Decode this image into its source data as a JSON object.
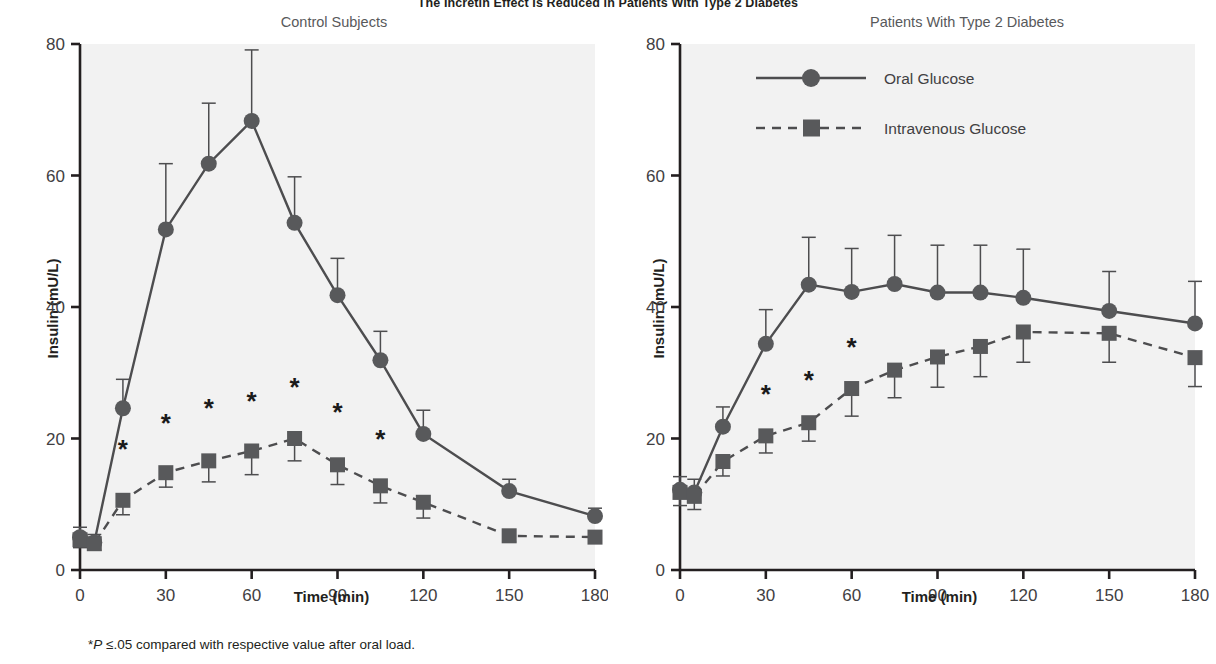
{
  "figure": {
    "title": "The Incretin Effect Is Reduced in Patients With Type 2 Diabetes",
    "footnote_prefix": "*",
    "footnote_italic": "P",
    "footnote_rest": " ≤.05 compared with respective value after oral load.",
    "footnote_full": "*P ≤.05 compared with respective value after oral load.",
    "colors": {
      "line": "#4d4d4f",
      "marker": "#58595b",
      "axis": "#231f20",
      "plot_bg": "#f2f2f2",
      "tick_label": "#414042",
      "panel_title": "#58595b"
    }
  },
  "legend": {
    "position": "top-right-of-right-panel",
    "items": [
      {
        "label": "Oral Glucose",
        "marker": "circle",
        "line_style": "solid"
      },
      {
        "label": "Intravenous Glucose",
        "marker": "square",
        "line_style": "dashed"
      }
    ]
  },
  "chart_data": [
    {
      "type": "line",
      "panel": "left",
      "title": "Control Subjects",
      "xlabel": "Time (min)",
      "ylabel": "Insulin (mU/L)",
      "xlim": [
        0,
        180
      ],
      "ylim": [
        0,
        80
      ],
      "xticks": [
        0,
        30,
        60,
        90,
        120,
        150,
        180
      ],
      "yticks": [
        0,
        20,
        40,
        60,
        80
      ],
      "grid": false,
      "x": [
        0,
        5,
        15,
        30,
        45,
        60,
        75,
        90,
        105,
        120,
        150,
        180
      ],
      "series": [
        {
          "name": "Oral Glucose",
          "marker": "circle",
          "line_style": "solid",
          "values": [
            5.0,
            4.2,
            24.6,
            51.8,
            61.8,
            68.3,
            52.8,
            41.8,
            31.9,
            20.7,
            12.0,
            8.2
          ],
          "errors": [
            1.5,
            1.2,
            4.4,
            10.0,
            9.2,
            10.8,
            7.0,
            5.6,
            4.4,
            3.6,
            1.8,
            1.2
          ]
        },
        {
          "name": "Intravenous Glucose",
          "marker": "square",
          "line_style": "dashed",
          "values": [
            4.6,
            4.0,
            10.6,
            14.8,
            16.6,
            18.1,
            20.0,
            16.0,
            12.8,
            10.3,
            5.2,
            5.0
          ],
          "errors": [
            1.2,
            1.0,
            2.2,
            2.2,
            3.2,
            3.6,
            3.4,
            3.0,
            2.6,
            2.4,
            0.9,
            0.9
          ]
        }
      ],
      "annotations": [
        {
          "text": "*",
          "x": 15,
          "y": 17.0
        },
        {
          "text": "*",
          "x": 30,
          "y": 21.0
        },
        {
          "text": "*",
          "x": 45,
          "y": 23.2
        },
        {
          "text": "*",
          "x": 60,
          "y": 24.4
        },
        {
          "text": "*",
          "x": 75,
          "y": 26.4
        },
        {
          "text": "*",
          "x": 90,
          "y": 22.6
        },
        {
          "text": "*",
          "x": 105,
          "y": 18.6
        }
      ]
    },
    {
      "type": "line",
      "panel": "right",
      "title": "Patients With Type 2 Diabetes",
      "xlabel": "Time (min)",
      "ylabel": "Insulin (mU/L)",
      "xlim": [
        0,
        180
      ],
      "ylim": [
        0,
        80
      ],
      "xticks": [
        0,
        30,
        60,
        90,
        120,
        150,
        180
      ],
      "yticks": [
        0,
        20,
        40,
        60,
        80
      ],
      "grid": false,
      "x": [
        0,
        5,
        15,
        30,
        45,
        60,
        75,
        90,
        105,
        120,
        150,
        180
      ],
      "series": [
        {
          "name": "Oral Glucose",
          "marker": "circle",
          "line_style": "solid",
          "values": [
            12.2,
            11.8,
            21.8,
            34.4,
            43.4,
            42.3,
            43.5,
            42.2,
            42.2,
            41.4,
            39.4,
            37.5
          ],
          "errors": [
            2.0,
            2.0,
            3.0,
            5.2,
            7.2,
            6.6,
            7.4,
            7.2,
            7.2,
            7.4,
            6.0,
            6.4
          ]
        },
        {
          "name": "Intravenous Glucose",
          "marker": "square",
          "line_style": "dashed",
          "values": [
            11.8,
            11.2,
            16.5,
            20.4,
            22.4,
            27.6,
            30.4,
            32.4,
            34.0,
            36.2,
            36.0,
            32.3
          ],
          "errors": [
            2.0,
            2.0,
            2.2,
            2.6,
            2.8,
            4.2,
            4.2,
            4.6,
            4.6,
            4.6,
            4.4,
            4.4
          ]
        }
      ],
      "annotations": [
        {
          "text": "*",
          "x": 30,
          "y": 25.4
        },
        {
          "text": "*",
          "x": 45,
          "y": 27.6
        },
        {
          "text": "*",
          "x": 60,
          "y": 32.6
        }
      ]
    }
  ]
}
